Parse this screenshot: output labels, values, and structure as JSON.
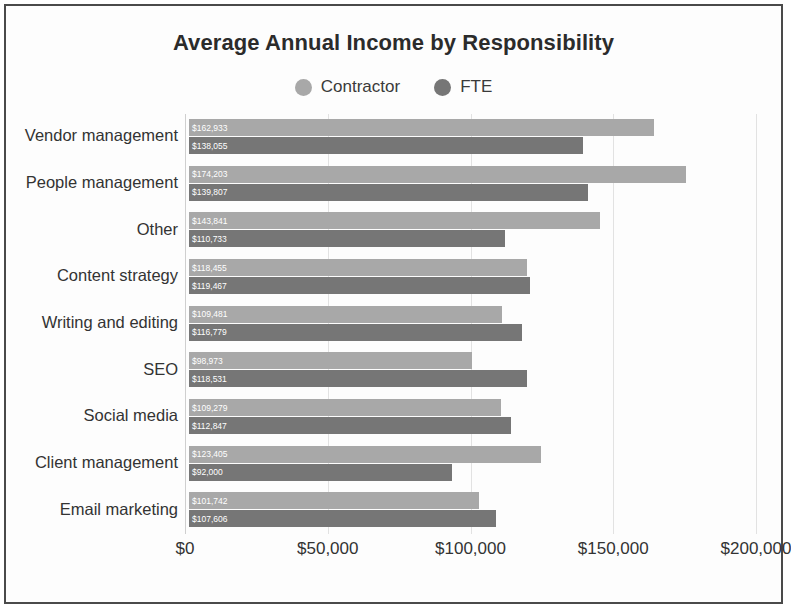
{
  "chart_data": {
    "type": "bar",
    "orientation": "horizontal",
    "title": "Average Annual Income by Responsibility",
    "xlabel": "",
    "ylabel": "",
    "xlim": [
      0,
      200000
    ],
    "xticks": [
      "$0",
      "$50,000",
      "$100,000",
      "$150,000",
      "$200,000"
    ],
    "xtick_values": [
      0,
      50000,
      100000,
      150000,
      200000
    ],
    "grid": true,
    "grid_axis": "x",
    "legend_position": "top-center",
    "categories": [
      "Vendor management",
      "People management",
      "Other",
      "Content strategy",
      "Writing and editing",
      "SEO",
      "Social media",
      "Client management",
      "Email marketing"
    ],
    "series": [
      {
        "name": "Contractor",
        "color": "#a8a8a8",
        "values": [
          162933,
          174203,
          143841,
          118455,
          109481,
          98973,
          109279,
          123405,
          101742
        ],
        "labels": [
          "$162,933",
          "$174,203",
          "$143,841",
          "$118,455",
          "$109,481",
          "$98,973",
          "$109,279",
          "$123,405",
          "$101,742"
        ]
      },
      {
        "name": "FTE",
        "color": "#767676",
        "values": [
          138055,
          139807,
          110733,
          119467,
          116779,
          118531,
          112847,
          92000,
          107606
        ],
        "labels": [
          "$138,055",
          "$139,807",
          "$110,733",
          "$119,467",
          "$116,779",
          "$118,531",
          "$112,847",
          "$92,000",
          "$107,606"
        ]
      }
    ]
  }
}
